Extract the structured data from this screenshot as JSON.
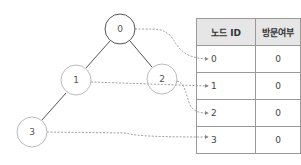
{
  "graph": {
    "nodes": [
      {
        "id": "0",
        "x": 120,
        "y": 29
      },
      {
        "id": "1",
        "x": 76,
        "y": 80
      },
      {
        "id": "2",
        "x": 162,
        "y": 79
      },
      {
        "id": "3",
        "x": 32,
        "y": 132
      }
    ],
    "edges": [
      [
        "0",
        "1"
      ],
      [
        "0",
        "2"
      ],
      [
        "1",
        "3"
      ]
    ]
  },
  "table": {
    "headers": [
      "노드 ID",
      "방문여부"
    ],
    "rows": [
      {
        "id": "0",
        "visited": "0"
      },
      {
        "id": "1",
        "visited": "0"
      },
      {
        "id": "2",
        "visited": "0"
      },
      {
        "id": "3",
        "visited": "0"
      }
    ]
  },
  "colors": {
    "edge": "#555555",
    "node_border": "#bbbbbb",
    "root_border": "#555555",
    "arrow": "#888888"
  }
}
